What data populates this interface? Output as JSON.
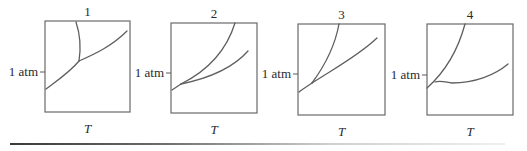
{
  "figure": {
    "panels": [
      {
        "number": "1",
        "y_label": "1 atm",
        "x_label": "T",
        "box": {
          "x": 45,
          "y": 21,
          "w": 85,
          "h": 91
        },
        "y_tick_y": 72,
        "curves": [
          "M46,89 C58,80 70,72 79,61",
          "M79,61 C81,48 80,34 76,22",
          "M79,61 C95,54 112,46 127,31"
        ]
      },
      {
        "number": "2",
        "y_label": "1 atm",
        "x_label": "T",
        "box": {
          "x": 171,
          "y": 23,
          "w": 86,
          "h": 90
        },
        "y_tick_y": 73,
        "curves": [
          "M172,90 C175,88 178,86 181,84",
          "M181,84 C205,72 226,52 235,23",
          "M181,84 C210,78 233,68 248,51"
        ]
      },
      {
        "number": "3",
        "y_label": "1 atm",
        "x_label": "T",
        "box": {
          "x": 298,
          "y": 24,
          "w": 87,
          "h": 91
        },
        "y_tick_y": 74,
        "curves": [
          "M299,92 C304,88 308,86 312,83",
          "M312,83 C326,64 335,46 339,24",
          "M312,83 C335,68 358,56 377,38"
        ]
      },
      {
        "number": "4",
        "y_label": "1 atm",
        "x_label": "T",
        "box": {
          "x": 427,
          "y": 24,
          "w": 86,
          "h": 91
        },
        "y_tick_y": 75,
        "curves": [
          "M427,88 C445,72 458,50 465,24",
          "M435,82 C440,80 445,82 452,83 C475,83 495,75 508,64"
        ]
      }
    ]
  }
}
